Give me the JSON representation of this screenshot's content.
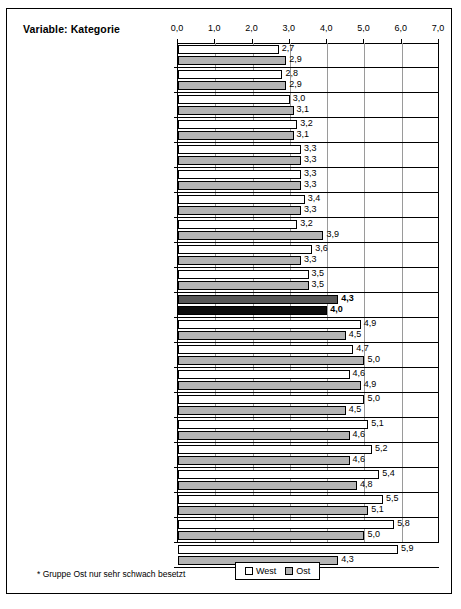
{
  "title": "Variable: Kategorie",
  "footnote": "* Gruppe Ost nur sehr schwach besetzt",
  "legend": {
    "west": "West",
    "ost": "Ost"
  },
  "colors": {
    "west_fill": "#ffffff",
    "ost_fill": "#b4b4b4",
    "highlight_west": "#585858",
    "highlight_ost": "#0d0d0d",
    "grid": "#9a9a9a",
    "axis": "#000000"
  },
  "chart_data": {
    "type": "bar",
    "orientation": "horizontal",
    "title": "Variable: Kategorie",
    "xlabel": "",
    "ylabel": "",
    "xlim": [
      0.0,
      7.0
    ],
    "xticks": [
      "0,0",
      "1,0",
      "2,0",
      "3,0",
      "4,0",
      "5,0",
      "6,0",
      "7,0"
    ],
    "xtick_values": [
      0,
      1,
      2,
      3,
      4,
      5,
      6,
      7
    ],
    "grid": true,
    "legend_position": "bottom-center",
    "categories": [
      "Beschäftigungsstatus: verbeamtet*",
      "Ausbildungsniveau: FHS/IngSch/Uni",
      "Soziale Schicht: obere Schicht",
      "Lernförderlichkeit der Arbeit: hoch",
      "Berufsverlauf: aufwärts",
      "Arbeitsorientierung: inhaltl.expressiv",
      "Freizeitaktivität: hoch",
      "Arbeitsorientierung: aufstiegsorientiert",
      "Wahrnehmung sozioökonomischer\nWandel: eher Chance",
      "Wirtschaftsbereich: öffentlicher Dienst",
      "Ältere: insgesamt",
      "Mobilitätstyp: wenig mobil",
      "Erwerbsstatus: stille Reserve",
      "wirtschaftsbereich: Landwirtschaft etc.",
      "Freizeitaktivität: niedrig",
      "Arbeitsorientierung: mater.-reprod.",
      "Arbeit mit Computer: nein",
      "Erwerbstatus: arbeitslos",
      "Soziale Schicht: untere Schicht",
      "Lernförderlichkeit: niedrig",
      "Ausbildungsniveau: keine/sonstige*"
    ],
    "series": [
      {
        "name": "West",
        "values": [
          2.7,
          2.8,
          3.0,
          3.2,
          3.3,
          3.3,
          3.4,
          3.2,
          3.6,
          3.5,
          4.3,
          4.9,
          4.7,
          4.6,
          5.0,
          5.1,
          5.2,
          5.4,
          5.5,
          5.8,
          5.9
        ],
        "labels": [
          "2,7",
          "2,8",
          "3,0",
          "3,2",
          "3,3",
          "3,3",
          "3,4",
          "3,2",
          "3,6",
          "3,5",
          "4,3",
          "4,9",
          "4,7",
          "4,6",
          "5,0",
          "5,1",
          "5,2",
          "5,4",
          "5,5",
          "5,8",
          "5,9"
        ]
      },
      {
        "name": "Ost",
        "values": [
          2.9,
          2.9,
          3.1,
          3.1,
          3.3,
          3.3,
          3.3,
          3.9,
          3.3,
          3.5,
          4.0,
          4.5,
          5.0,
          4.9,
          4.5,
          4.6,
          4.6,
          4.8,
          5.1,
          5.0,
          4.3
        ],
        "labels": [
          "2,9",
          "2,9",
          "3,1",
          "3,1",
          "3,3",
          "3,3",
          "3,3",
          "3,9",
          "3,3",
          "3,5",
          "4,0",
          "4,5",
          "5,0",
          "4,9",
          "4,5",
          "4,6",
          "4,6",
          "4,8",
          "5,1",
          "5,0",
          "4,3"
        ]
      }
    ],
    "highlight_index": 10
  }
}
